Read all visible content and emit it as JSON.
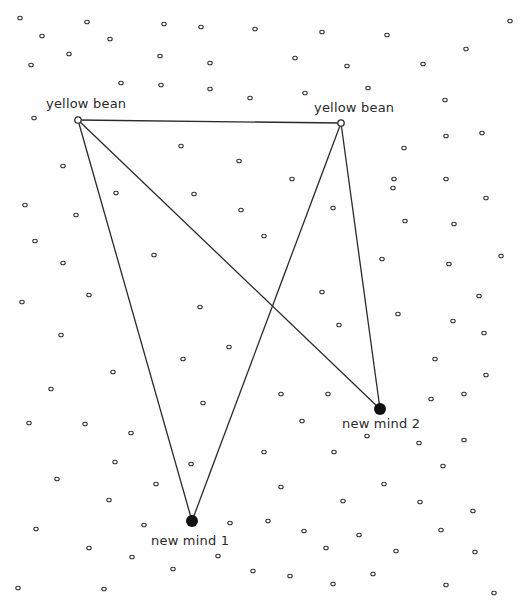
{
  "diagram": {
    "width": 527,
    "height": 609,
    "colors": {
      "background": "#fefefe",
      "line": "#2a2a2a",
      "dot_stroke": "#333333",
      "node_filled": "#111111"
    },
    "nodes": [
      {
        "id": "yb1",
        "label": "yellow bean",
        "type": "hollow",
        "x": 78,
        "y": 120,
        "label_x": 46,
        "label_y": 96
      },
      {
        "id": "yb2",
        "label": "yellow bean",
        "type": "hollow",
        "x": 341,
        "y": 123,
        "label_x": 314,
        "label_y": 100
      },
      {
        "id": "nm1",
        "label": "new mind 1",
        "type": "filled",
        "x": 192,
        "y": 521,
        "label_x": 151,
        "label_y": 533
      },
      {
        "id": "nm2",
        "label": "new mind 2",
        "type": "filled",
        "x": 380,
        "y": 409,
        "label_x": 342,
        "label_y": 416
      }
    ],
    "edges": [
      {
        "from": "yb1",
        "to": "yb2"
      },
      {
        "from": "yb1",
        "to": "nm1"
      },
      {
        "from": "yb1",
        "to": "nm2"
      },
      {
        "from": "yb2",
        "to": "nm1"
      },
      {
        "from": "yb2",
        "to": "nm2"
      }
    ],
    "background_points": [
      [
        20,
        18
      ],
      [
        87,
        22
      ],
      [
        164,
        24
      ],
      [
        201,
        27
      ],
      [
        255,
        29
      ],
      [
        42,
        36
      ],
      [
        110,
        39
      ],
      [
        69,
        54
      ],
      [
        160,
        56
      ],
      [
        210,
        63
      ],
      [
        31,
        65
      ],
      [
        121,
        83
      ],
      [
        161,
        85
      ],
      [
        210,
        89
      ],
      [
        250,
        98
      ],
      [
        34,
        118
      ],
      [
        322,
        32
      ],
      [
        387,
        35
      ],
      [
        466,
        49
      ],
      [
        510,
        21
      ],
      [
        295,
        58
      ],
      [
        347,
        66
      ],
      [
        423,
        64
      ],
      [
        305,
        93
      ],
      [
        368,
        88
      ],
      [
        445,
        100
      ],
      [
        446,
        136
      ],
      [
        482,
        133
      ],
      [
        404,
        148
      ],
      [
        181,
        146
      ],
      [
        239,
        161
      ],
      [
        63,
        166
      ],
      [
        292,
        179
      ],
      [
        116,
        193
      ],
      [
        194,
        194
      ],
      [
        394,
        179
      ],
      [
        446,
        179
      ],
      [
        393,
        188
      ],
      [
        486,
        198
      ],
      [
        25,
        205
      ],
      [
        76,
        215
      ],
      [
        241,
        210
      ],
      [
        333,
        208
      ],
      [
        35,
        241
      ],
      [
        264,
        236
      ],
      [
        405,
        221
      ],
      [
        454,
        224
      ],
      [
        63,
        263
      ],
      [
        154,
        255
      ],
      [
        382,
        259
      ],
      [
        449,
        264
      ],
      [
        501,
        256
      ],
      [
        22,
        302
      ],
      [
        89,
        295
      ],
      [
        200,
        307
      ],
      [
        322,
        292
      ],
      [
        479,
        296
      ],
      [
        398,
        314
      ],
      [
        453,
        321
      ],
      [
        61,
        335
      ],
      [
        339,
        325
      ],
      [
        484,
        333
      ],
      [
        113,
        372
      ],
      [
        51,
        389
      ],
      [
        183,
        359
      ],
      [
        229,
        347
      ],
      [
        435,
        359
      ],
      [
        486,
        375
      ],
      [
        281,
        394
      ],
      [
        328,
        394
      ],
      [
        431,
        399
      ],
      [
        464,
        394
      ],
      [
        29,
        423
      ],
      [
        85,
        424
      ],
      [
        131,
        433
      ],
      [
        203,
        403
      ],
      [
        302,
        421
      ],
      [
        367,
        436
      ],
      [
        419,
        443
      ],
      [
        464,
        440
      ],
      [
        115,
        462
      ],
      [
        191,
        464
      ],
      [
        264,
        452
      ],
      [
        334,
        452
      ],
      [
        443,
        466
      ],
      [
        57,
        479
      ],
      [
        156,
        484
      ],
      [
        281,
        487
      ],
      [
        384,
        484
      ],
      [
        109,
        500
      ],
      [
        343,
        501
      ],
      [
        420,
        502
      ],
      [
        473,
        511
      ],
      [
        36,
        529
      ],
      [
        144,
        525
      ],
      [
        230,
        523
      ],
      [
        268,
        521
      ],
      [
        304,
        531
      ],
      [
        359,
        535
      ],
      [
        441,
        530
      ],
      [
        89,
        548
      ],
      [
        132,
        557
      ],
      [
        218,
        556
      ],
      [
        326,
        548
      ],
      [
        396,
        551
      ],
      [
        475,
        552
      ],
      [
        173,
        569
      ],
      [
        253,
        571
      ],
      [
        290,
        576
      ],
      [
        333,
        584
      ],
      [
        373,
        574
      ],
      [
        446,
        585
      ],
      [
        18,
        588
      ],
      [
        104,
        589
      ],
      [
        494,
        593
      ]
    ]
  }
}
